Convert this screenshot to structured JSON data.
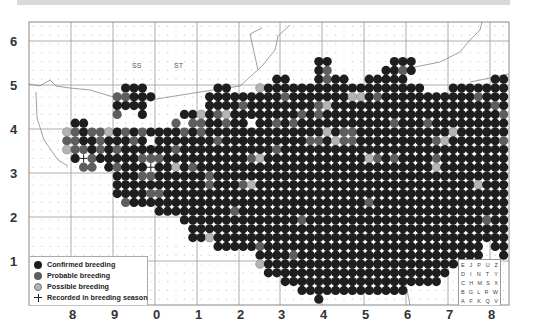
{
  "header": {
    "bar": ""
  },
  "map": {
    "frame": {
      "x": 29,
      "y": 22,
      "w": 480,
      "h": 283
    },
    "colors": {
      "confirmed": "#1e1e1e",
      "probable": "#5e5e5e",
      "possible": "#b4b4b4",
      "outline": "#777777",
      "grid": "#9a9a9a",
      "gridDot": "#c4c4c4"
    },
    "vlines": [
      71,
      113,
      155,
      197,
      239,
      280,
      322,
      364,
      406,
      448,
      490
    ],
    "hlines": [
      41,
      85,
      129,
      173,
      217,
      261
    ],
    "square_labels": [
      {
        "text": "SS",
        "x": 132,
        "y": 62
      },
      {
        "text": "ST",
        "x": 174,
        "y": 62
      }
    ],
    "grid": {
      "x0": 33.2,
      "y0": 26.4,
      "dx": 8.4,
      "dy": 8.8,
      "rows": [
        "..................................................................",
        "..................................................................",
        "..................................................................",
        "...............................................................................",
        "..................................CC.......CCC.....................................",
        "..................................CP......CCPC.............................",
        ".............................CC...CPCC..CCCCC..........CCC..CSPC...",
        "...........CCC........CC...SCCCCCCCCCCCCCCCCCCC...CCCCCCCCCCPCCCC.",
        "..........PPCCC......CCCCCCCCCPCCCCCCCSSCPCCCCCCCCCCCPCCCCCCCCPCC..",
        "..........CCCC.......CCCCPCCCCCCCCPSCCCCCCCCCCCCCCCCCCCPCCCCCCCPCS.",
        "..........P..C....CCSCPSCCCCCCCCPCPCCCCCCCCCCCCCCCCCCCCCPCCSCCCCCCC.",
        ".....CC..........P.PPCCPCC.CCPCPCCCCCCCCCCCPCCCPCCCCCCCCCCSCCPCCPSC.",
        "....SPCPPSCPCPCCCCPCPCCCCCCCCCCCCCCSCPPCCCCCCCCCCCSCCCCCCCPCCSCCCC..",
        "....PPCCPCCCPC.CCCCCCCPCCCCCCCCCCPPCSPPCCCCCCCCCPSCCCCCCPCCCSCCCCC..",
        "....SPPCPCPCCCCCCPCCCCCCCCCCCPCCCCCCCCCCCCCCCCCCCCCCCCCCCCCSCCCPCC..",
        ".....CRPCCCCCPPPCCCCCCCCCCPSCCCCCCCCCCCCSPCPCCCCPCCCCCCCCCCCCCCCCC..",
        "......PP.CPCCCRCCSCPCCCCCCCCCCCCCCCCCCCCCCCCCCCCSCCCCCCCCCCSSCCCCC..",
        "..........CCCPPCCCCCCPCCCCCCCCCCCCCCCCCCCCCCCCCCCCCCCCCCCCCCCCCCC...",
        "..........CCCCCCCCCCCPCCCPSCCCCCCCCCCCCCCCCCCCCCCCCCCSCCCCCPCC......",
        "..........CCCCPPCCCCCCCCCCCCCCCCCCCCCCCCCCCCCCCCCCCCCCCCCCCCCC......",
        "...........PCCCCCCCCCCCCCCCCCCCCCCCCCCCCPCCCCCCCCCCCCCCCCCCCCC......",
        "...............CCCCCCCCCPCCCCCCCCCCCCCCCCCCCCCCCCCCCCCCCCCCCC.......",
        "..................CCCCCCCCCCCCCCPCCCCCCCCCCCCCCCCCCCCCPCCCC.........",
        "...................CCCCCCCCCCCCCCCCCCCCCCCCCCCCCCCCCCCCCCC..........",
        "...................CCSCCCCCCCCCCCCCCCCCCCCCCCCCCCCCCCCCCCCC.........",
        "......................CCCCCPCCCCCCCCCCCCCCCCCCCCCCCCCC.CCCC.........",
        "...........................CCCCPCCCCCCCCCCCCCCCCCCCCCC..CC..........",
        "...........................SCCCCCCCCCCCCCCCCCCCCCCCC.....C..........",
        "............................CCCCCCCCCCCCCCCCCCCCCC.................",
        "..............................CCCCCCCCCCCCCCCCCCC..................",
        "................................CCCCCCCCCCCCC......................",
        "..................................C................................",
        ".................................................................."
      ]
    }
  },
  "axes": {
    "y_labels": [
      {
        "text": "6",
        "x": 10,
        "y": 34
      },
      {
        "text": "5",
        "x": 10,
        "y": 78
      },
      {
        "text": "4",
        "x": 10,
        "y": 122
      },
      {
        "text": "3",
        "x": 10,
        "y": 166
      },
      {
        "text": "2",
        "x": 10,
        "y": 210
      },
      {
        "text": "1",
        "x": 10,
        "y": 254
      }
    ],
    "x_labels": [
      {
        "text": "8",
        "x": 69,
        "y": 307
      },
      {
        "text": "9",
        "x": 111,
        "y": 307
      },
      {
        "text": "0",
        "x": 153,
        "y": 307
      },
      {
        "text": "1",
        "x": 195,
        "y": 307
      },
      {
        "text": "2",
        "x": 237,
        "y": 307
      },
      {
        "text": "3",
        "x": 278,
        "y": 307
      },
      {
        "text": "4",
        "x": 320,
        "y": 307
      },
      {
        "text": "5",
        "x": 362,
        "y": 307
      },
      {
        "text": "6",
        "x": 404,
        "y": 307
      },
      {
        "text": "7",
        "x": 446,
        "y": 307
      },
      {
        "text": "8",
        "x": 488,
        "y": 307
      }
    ]
  },
  "legend": {
    "items": [
      {
        "label": "Confirmed breeding",
        "type": "confirmed"
      },
      {
        "label": "Probable breeding",
        "type": "probable"
      },
      {
        "label": "Possible breeding",
        "type": "possible"
      },
      {
        "label": "Recorded in breeding season",
        "type": "recorded"
      }
    ]
  },
  "tetrad_key": {
    "rows": [
      [
        "E",
        "J",
        "P",
        "U",
        "Z"
      ],
      [
        "D",
        "I",
        "N",
        "T",
        "Y"
      ],
      [
        "C",
        "H",
        "M",
        "S",
        "X"
      ],
      [
        "B",
        "G",
        "L",
        "R",
        "W"
      ],
      [
        "A",
        "F",
        "K",
        "Q",
        "V"
      ]
    ]
  }
}
